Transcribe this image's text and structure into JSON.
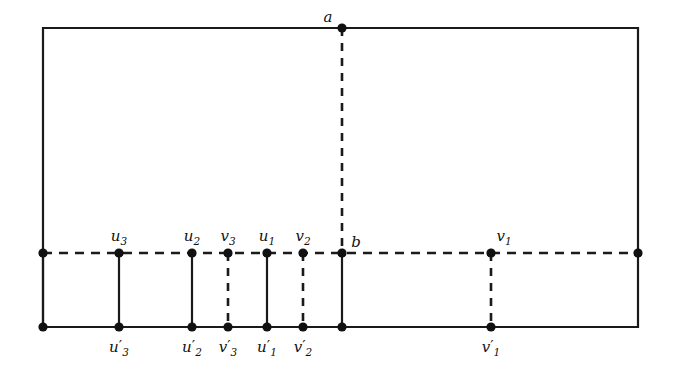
{
  "figure": {
    "kind": "graph-embedding-diagram",
    "background_color": "#ffffff",
    "ink_color": "#111111",
    "width": 674,
    "height": 375
  },
  "frame": {
    "name": "outer-rectangle",
    "style": "solid",
    "left": 43,
    "right": 638,
    "top": 28,
    "bottom": 327
  },
  "middle_line": {
    "name": "horizontal-dashed-line",
    "style": "dashed",
    "y": 253,
    "x_start": 43,
    "x_end": 638
  },
  "vertical_edges": [
    {
      "name": "left-border-segment",
      "x": 43,
      "style": "solid",
      "y_top": 253,
      "y_bottom": 327
    },
    {
      "name": "u3-segment",
      "x": 119,
      "style": "solid",
      "y_top": 253,
      "y_bottom": 327
    },
    {
      "name": "u2-segment",
      "x": 192,
      "style": "solid",
      "y_top": 253,
      "y_bottom": 327
    },
    {
      "name": "v3-segment",
      "x": 228,
      "style": "dashed",
      "y_top": 253,
      "y_bottom": 327
    },
    {
      "name": "u1-segment",
      "x": 267,
      "style": "solid",
      "y_top": 253,
      "y_bottom": 327
    },
    {
      "name": "v2-segment",
      "x": 303,
      "style": "dashed",
      "y_top": 253,
      "y_bottom": 327
    },
    {
      "name": "b-segment",
      "x": 342,
      "style": "solid",
      "y_top": 253,
      "y_bottom": 327
    },
    {
      "name": "v1-segment",
      "x": 491,
      "style": "dashed",
      "y_top": 253,
      "y_bottom": 327
    },
    {
      "name": "ab-segment",
      "x": 342,
      "style": "dashed",
      "y_top": 28,
      "y_bottom": 253
    }
  ],
  "vertices": [
    {
      "name": "a",
      "label": "a",
      "sub": "",
      "prime": false,
      "x": 342,
      "y": 28,
      "label_x": 328,
      "label_y": 22,
      "anchor": "middle"
    },
    {
      "name": "b",
      "label": "b",
      "sub": "",
      "prime": false,
      "x": 342,
      "y": 253,
      "label_x": 356,
      "label_y": 247,
      "anchor": "middle"
    },
    {
      "name": "left-mid",
      "label": "",
      "sub": "",
      "prime": false,
      "x": 43,
      "y": 253,
      "label_x": 43,
      "label_y": 243,
      "anchor": "middle"
    },
    {
      "name": "right-mid",
      "label": "",
      "sub": "",
      "prime": false,
      "x": 638,
      "y": 253,
      "label_x": 638,
      "label_y": 243,
      "anchor": "middle"
    },
    {
      "name": "u3",
      "label": "u",
      "sub": "3",
      "prime": false,
      "x": 119,
      "y": 253,
      "label_x": 119,
      "label_y": 241,
      "anchor": "middle"
    },
    {
      "name": "u2",
      "label": "u",
      "sub": "2",
      "prime": false,
      "x": 192,
      "y": 253,
      "label_x": 192,
      "label_y": 241,
      "anchor": "middle"
    },
    {
      "name": "v3",
      "label": "v",
      "sub": "3",
      "prime": false,
      "x": 228,
      "y": 253,
      "label_x": 228,
      "label_y": 241,
      "anchor": "middle"
    },
    {
      "name": "u1",
      "label": "u",
      "sub": "1",
      "prime": false,
      "x": 267,
      "y": 253,
      "label_x": 267,
      "label_y": 241,
      "anchor": "middle"
    },
    {
      "name": "v2",
      "label": "v",
      "sub": "2",
      "prime": false,
      "x": 303,
      "y": 253,
      "label_x": 303,
      "label_y": 241,
      "anchor": "middle"
    },
    {
      "name": "v1",
      "label": "v",
      "sub": "1",
      "prime": false,
      "x": 491,
      "y": 253,
      "label_x": 504,
      "label_y": 241,
      "anchor": "middle"
    },
    {
      "name": "bottom-left-corner",
      "label": "",
      "sub": "",
      "prime": false,
      "x": 43,
      "y": 327,
      "label_x": 43,
      "label_y": 350,
      "anchor": "middle"
    },
    {
      "name": "u3p",
      "label": "u",
      "sub": "3",
      "prime": true,
      "x": 119,
      "y": 327,
      "label_x": 119,
      "label_y": 352,
      "anchor": "middle"
    },
    {
      "name": "u2p",
      "label": "u",
      "sub": "2",
      "prime": true,
      "x": 192,
      "y": 327,
      "label_x": 192,
      "label_y": 352,
      "anchor": "middle"
    },
    {
      "name": "v3p",
      "label": "v",
      "sub": "3",
      "prime": true,
      "x": 228,
      "y": 327,
      "label_x": 228,
      "label_y": 352,
      "anchor": "middle"
    },
    {
      "name": "u1p",
      "label": "u",
      "sub": "1",
      "prime": true,
      "x": 267,
      "y": 327,
      "label_x": 267,
      "label_y": 352,
      "anchor": "middle"
    },
    {
      "name": "v2p",
      "label": "v",
      "sub": "2",
      "prime": true,
      "x": 303,
      "y": 327,
      "label_x": 303,
      "label_y": 352,
      "anchor": "middle"
    },
    {
      "name": "b-bottom",
      "label": "",
      "sub": "",
      "prime": false,
      "x": 342,
      "y": 327,
      "label_x": 342,
      "label_y": 352,
      "anchor": "middle"
    },
    {
      "name": "v1p",
      "label": "v",
      "sub": "1",
      "prime": true,
      "x": 491,
      "y": 327,
      "label_x": 491,
      "label_y": 352,
      "anchor": "middle"
    }
  ],
  "dot_radius": 4.6
}
